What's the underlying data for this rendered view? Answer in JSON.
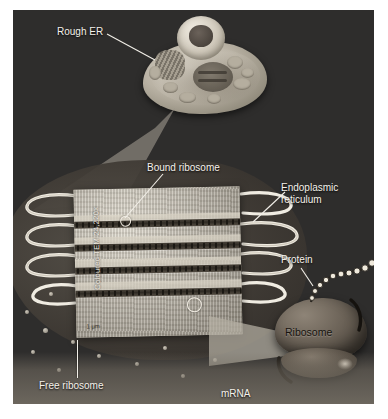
{
  "figure": {
    "background_color": "#2e2d2c",
    "label_color": "#f4f1ea"
  },
  "labels": {
    "rough_er": "Rough ER",
    "bound_ribosome": "Bound ribosome",
    "endoplasmic_reticulum_line1": "Endoplasmic",
    "endoplasmic_reticulum_line2": "reticulum",
    "protein": "Protein",
    "ribosome": "Ribosome",
    "free_ribosome": "Free ribosome",
    "mrna": "mRNA"
  },
  "micrograph": {
    "credit": "Coloured TEM 24,220×",
    "scale_text": "1 µm"
  }
}
